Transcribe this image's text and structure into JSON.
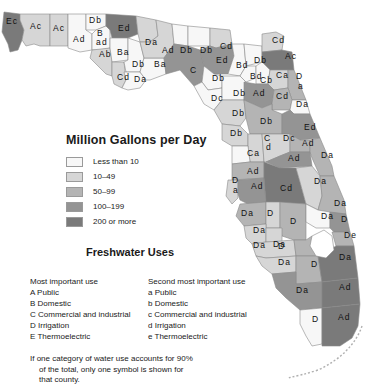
{
  "legend": {
    "title": "Million Gallons per Day",
    "items": [
      {
        "label": "Less than 10",
        "level": 0,
        "color": "#f7f7f7"
      },
      {
        "label": "10–49",
        "level": 1,
        "color": "#d6d6d6"
      },
      {
        "label": "50–99",
        "level": 2,
        "color": "#b4b4b4"
      },
      {
        "label": "100–199",
        "level": 3,
        "color": "#949494"
      },
      {
        "label": "200 or more",
        "level": 4,
        "color": "#7a7a7a"
      }
    ]
  },
  "uses": {
    "title": "Freshwater Uses",
    "primary": {
      "heading": "Most important use",
      "items": [
        "A  Public",
        "B  Domestic",
        "C  Commercial and industrial",
        "D  Irrigation",
        "E  Thermoelectric"
      ]
    },
    "secondary": {
      "heading": "Second most important use",
      "items": [
        "a  Public",
        "b  Domestic",
        "c  Commercial and industrial",
        "d  Irrigation",
        "e  Thermoelectric"
      ]
    },
    "note": [
      "If one category of water use accounts for 90%",
      "of the total, only one symbol is shown for",
      "that county."
    ]
  },
  "counties": [
    {
      "code": "Ec",
      "level": 4,
      "lx": 6,
      "ly": 24
    },
    {
      "code": "Ac",
      "level": 1,
      "lx": 30,
      "ly": 29
    },
    {
      "code": "Ac",
      "level": 1,
      "lx": 53,
      "ly": 31
    },
    {
      "code": "Ad",
      "level": 0,
      "lx": 73,
      "ly": 42
    },
    {
      "code": "Db",
      "level": 0,
      "lx": 89,
      "ly": 23
    },
    {
      "code": "B",
      "level": 0,
      "lx": 97,
      "ly": 36
    },
    {
      "code": "ad",
      "level": 0,
      "lx": 96,
      "ly": 45
    },
    {
      "code": "Ab",
      "level": 1,
      "lx": 99,
      "ly": 57
    },
    {
      "code": "Ed",
      "level": 4,
      "lx": 118,
      "ly": 31
    },
    {
      "code": "Ba",
      "level": 0,
      "lx": 117,
      "ly": 55
    },
    {
      "code": "Cd",
      "level": 1,
      "lx": 117,
      "ly": 80
    },
    {
      "code": "Db",
      "level": 0,
      "lx": 132,
      "ly": 67
    },
    {
      "code": "Da",
      "level": 0,
      "lx": 134,
      "ly": 82
    },
    {
      "code": "Ba",
      "level": 0,
      "lx": 154,
      "ly": 67
    },
    {
      "code": "Da",
      "level": 1,
      "lx": 145,
      "ly": 45
    },
    {
      "code": "Ad",
      "level": 1,
      "lx": 162,
      "ly": 53
    },
    {
      "code": "Db",
      "level": 0,
      "lx": 180,
      "ly": 53
    },
    {
      "code": "Db",
      "level": 0,
      "lx": 200,
      "ly": 53
    },
    {
      "code": "Cd",
      "level": 1,
      "lx": 220,
      "ly": 49
    },
    {
      "code": "C",
      "level": 3,
      "lx": 190,
      "ly": 73
    },
    {
      "code": "Ed",
      "level": 3,
      "lx": 216,
      "ly": 63
    },
    {
      "code": "Db",
      "level": 0,
      "lx": 212,
      "ly": 81
    },
    {
      "code": "Bd",
      "level": 0,
      "lx": 236,
      "ly": 68
    },
    {
      "code": "Db",
      "level": 0,
      "lx": 254,
      "ly": 63
    },
    {
      "code": "Cd",
      "level": 1,
      "lx": 272,
      "ly": 43
    },
    {
      "code": "Ac",
      "level": 4,
      "lx": 285,
      "ly": 59
    },
    {
      "code": "Bd",
      "level": 0,
      "lx": 250,
      "ly": 79
    },
    {
      "code": "Cb",
      "level": 0,
      "lx": 260,
      "ly": 83
    },
    {
      "code": "Ca",
      "level": 1,
      "lx": 276,
      "ly": 78
    },
    {
      "code": "D",
      "level": 2,
      "lx": 296,
      "ly": 79
    },
    {
      "code": "a",
      "level": 2,
      "lx": 298,
      "ly": 89
    },
    {
      "code": "Dc",
      "level": 0,
      "lx": 211,
      "ly": 101
    },
    {
      "code": "Db",
      "level": 0,
      "lx": 233,
      "ly": 96
    },
    {
      "code": "Ad",
      "level": 3,
      "lx": 253,
      "ly": 96
    },
    {
      "code": "Cd",
      "level": 2,
      "lx": 276,
      "ly": 99
    },
    {
      "code": "Da",
      "level": 0,
      "lx": 296,
      "ly": 107
    },
    {
      "code": "Db",
      "level": 1,
      "lx": 232,
      "ly": 116
    },
    {
      "code": "Db",
      "level": 2,
      "lx": 260,
      "ly": 124
    },
    {
      "code": "Ed",
      "level": 3,
      "lx": 304,
      "ly": 130
    },
    {
      "code": "Db",
      "level": 1,
      "lx": 230,
      "ly": 136
    },
    {
      "code": "C",
      "level": 1,
      "lx": 264,
      "ly": 141
    },
    {
      "code": "d",
      "level": 1,
      "lx": 266,
      "ly": 150
    },
    {
      "code": "Dc",
      "level": 1,
      "lx": 283,
      "ly": 141
    },
    {
      "code": "Ad",
      "level": 2,
      "lx": 302,
      "ly": 146
    },
    {
      "code": "Ca",
      "level": 0,
      "lx": 247,
      "ly": 156
    },
    {
      "code": "Ad",
      "level": 3,
      "lx": 288,
      "ly": 161
    },
    {
      "code": "Da",
      "level": 2,
      "lx": 321,
      "ly": 158
    },
    {
      "code": "Ad",
      "level": 2,
      "lx": 247,
      "ly": 174
    },
    {
      "code": "D",
      "level": 1,
      "lx": 232,
      "ly": 183
    },
    {
      "code": "a",
      "level": 0,
      "lx": 233,
      "ly": 193
    },
    {
      "code": "Ad",
      "level": 3,
      "lx": 251,
      "ly": 189
    },
    {
      "code": "Cd",
      "level": 4,
      "lx": 280,
      "ly": 191
    },
    {
      "code": "Da",
      "level": 1,
      "lx": 314,
      "ly": 184
    },
    {
      "code": "Da",
      "level": 2,
      "lx": 241,
      "ly": 216
    },
    {
      "code": "D",
      "level": 1,
      "lx": 267,
      "ly": 216
    },
    {
      "code": "Da",
      "level": 2,
      "lx": 334,
      "ly": 206
    },
    {
      "code": "Da",
      "level": 1,
      "lx": 253,
      "ly": 233
    },
    {
      "code": "D",
      "level": 2,
      "lx": 290,
      "ly": 224
    },
    {
      "code": "Da",
      "level": 0,
      "lx": 321,
      "ly": 219
    },
    {
      "code": "D",
      "level": 3,
      "lx": 341,
      "ly": 222
    },
    {
      "code": "Da",
      "level": 1,
      "lx": 273,
      "ly": 247
    },
    {
      "code": "Da",
      "level": 1,
      "lx": 253,
      "ly": 248
    },
    {
      "code": "D",
      "level": 1,
      "lx": 278,
      "ly": 249
    },
    {
      "code": "De",
      "level": 2,
      "lx": 344,
      "ly": 238
    },
    {
      "code": "Da",
      "level": 1,
      "lx": 278,
      "ly": 265
    },
    {
      "code": "D",
      "level": 2,
      "lx": 311,
      "ly": 267
    },
    {
      "code": "Da",
      "level": 4,
      "lx": 339,
      "ly": 260
    },
    {
      "code": "Da",
      "level": 3,
      "lx": 296,
      "ly": 293
    },
    {
      "code": "Ad",
      "level": 4,
      "lx": 339,
      "ly": 290
    },
    {
      "code": "D",
      "level": 0,
      "lx": 312,
      "ly": 322
    },
    {
      "code": "Ad",
      "level": 4,
      "lx": 338,
      "ly": 320
    }
  ]
}
